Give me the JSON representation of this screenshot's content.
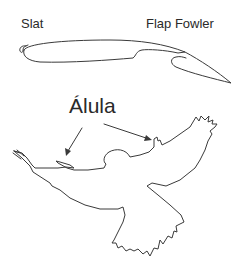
{
  "diagram": {
    "labels": {
      "slat": "Slat",
      "flap": "Flap Fowler",
      "alula": "Álula"
    },
    "parts": {
      "airfoil": "wing-airfoil-with-slat-and-fowler-flap",
      "bird": "bird-silhouette-outline"
    },
    "arrows": [
      {
        "from": "alula-label",
        "to": "left-wing-alula"
      },
      {
        "from": "alula-label",
        "to": "right-wing-alula"
      }
    ],
    "colors": {
      "line": "#3a3a3a",
      "text": "#2a2a2a",
      "background": "#ffffff"
    }
  }
}
